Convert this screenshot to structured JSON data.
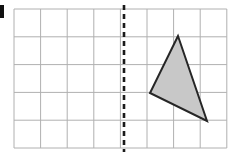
{
  "figure": {
    "canvas": {
      "width": 241,
      "height": 160,
      "background": "#ffffff"
    },
    "item_label": "a",
    "grid": {
      "name": "square-grid",
      "origin_x": 14,
      "origin_y": 9,
      "columns": 8,
      "rows": 5,
      "cell_width": 26.6,
      "cell_height": 27.8,
      "line_color": "#b0b0b0",
      "line_width": 1,
      "border_color": "#b0b0b0",
      "grid_on": true
    },
    "mirror_line": {
      "name": "mirror-line",
      "orientation": "vertical",
      "x": 124,
      "y_start": 5,
      "y_end": 152,
      "color": "#1a1a1a",
      "stroke_width": 2.6,
      "dash_on": 5,
      "dash_off": 4,
      "grid_column_index": 4
    },
    "triangle": {
      "name": "triangle-shape",
      "fill": "#c8c8c8",
      "stroke": "#262626",
      "stroke_width": 2,
      "vertices": [
        {
          "label": "apex",
          "x": 178,
          "y": 36
        },
        {
          "label": "left",
          "x": 150,
          "y": 93
        },
        {
          "label": "bottom-right",
          "x": 207,
          "y": 121
        }
      ],
      "points_attr": "178,36 150,93 207,121"
    }
  }
}
